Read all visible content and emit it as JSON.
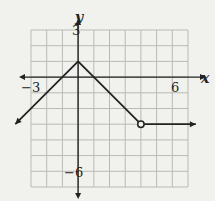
{
  "chart_data": {
    "type": "line",
    "title": "",
    "xlabel": "x",
    "ylabel": "y",
    "xlim": [
      -3,
      7
    ],
    "ylim": [
      -7,
      3
    ],
    "grid": true,
    "tick_labels": {
      "x": [
        "-3",
        "6"
      ],
      "y": [
        "3",
        "-6"
      ]
    },
    "series": [
      {
        "name": "left ray",
        "points": [
          [
            0,
            1
          ],
          [
            -4,
            -3
          ]
        ],
        "end": "arrow"
      },
      {
        "name": "middle segment",
        "points": [
          [
            0,
            1
          ],
          [
            4,
            -3
          ]
        ],
        "end": "open-circle"
      },
      {
        "name": "right ray",
        "points": [
          [
            4,
            -3
          ],
          [
            7.5,
            -3
          ]
        ],
        "end": "arrow"
      }
    ],
    "annotations": [
      {
        "type": "open-circle",
        "at": [
          4,
          -3
        ]
      }
    ]
  },
  "labels": {
    "x_axis": "x",
    "y_axis": "y",
    "x_min": "−3",
    "x_max": "6",
    "y_max": "3",
    "y_min": "−6"
  }
}
